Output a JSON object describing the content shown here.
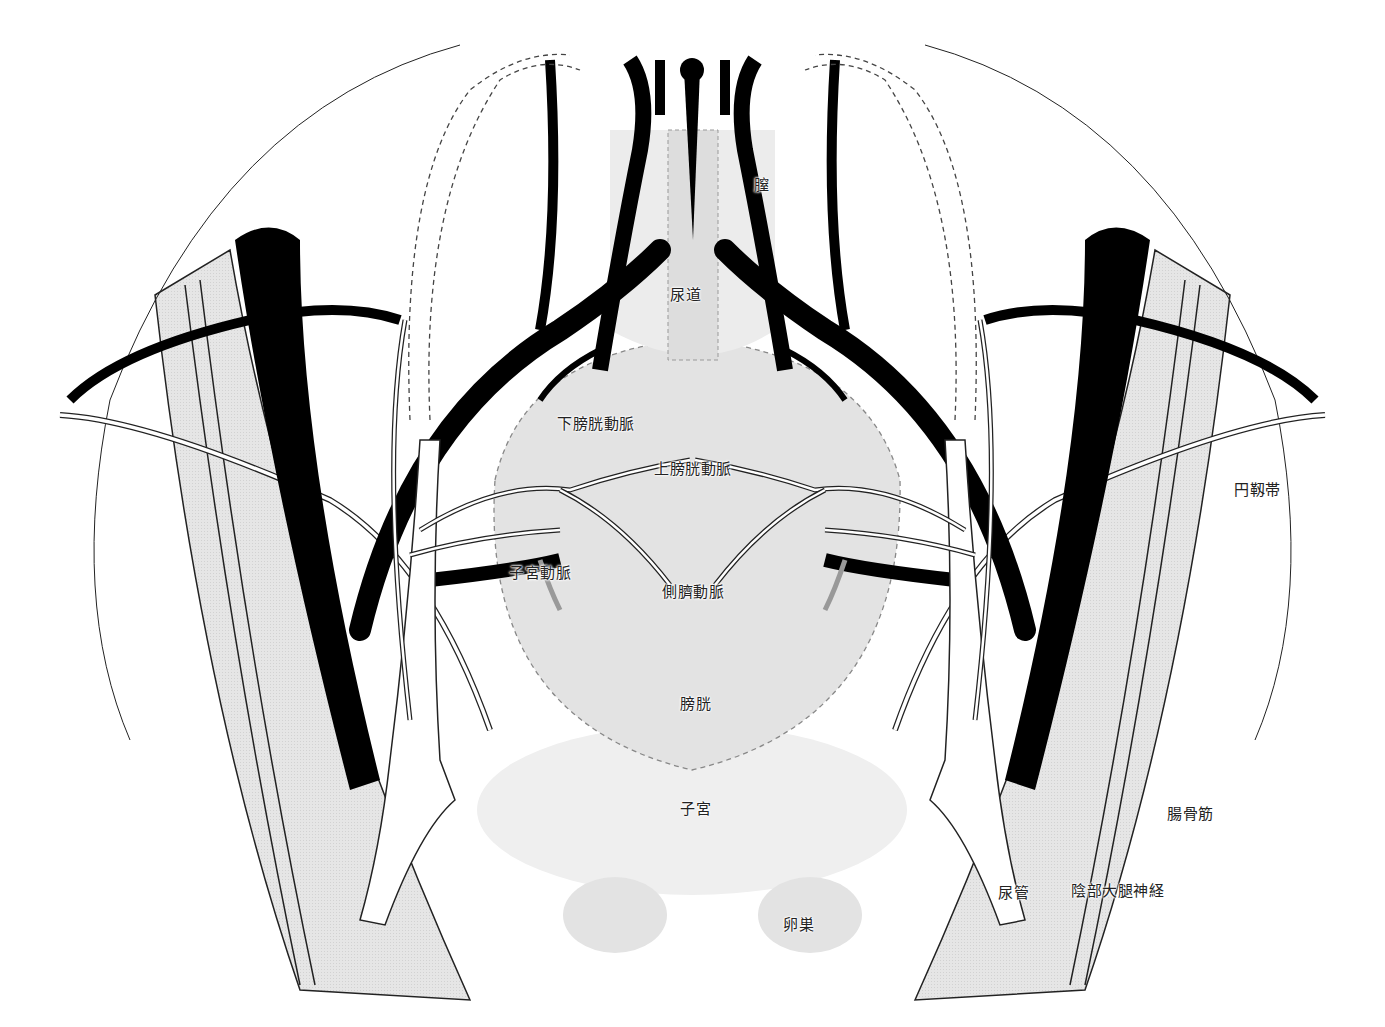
{
  "diagram": {
    "labels": {
      "vagina": "膣",
      "urethra": "尿道",
      "inferior_vesical_artery": "下膀胱動脈",
      "superior_vesical_artery": "上膀胱動脈",
      "uterine_artery": "子宮動脈",
      "lateral_umbilical_artery": "側臍動脈",
      "round_ligament": "円靱帯",
      "bladder": "膀胱",
      "uterus": "子宮",
      "ovary": "卵巣",
      "iliacus_muscle": "腸骨筋",
      "ureter": "尿管",
      "genitofemoral_nerve": "陰部大腿神経"
    },
    "colors": {
      "vessel": "#000000",
      "organ_fill": "#e3e3e3",
      "muscle_fill": "#dcdcdc",
      "outline": "#222222",
      "dashed_outline": "#888888",
      "background": "#ffffff"
    }
  }
}
